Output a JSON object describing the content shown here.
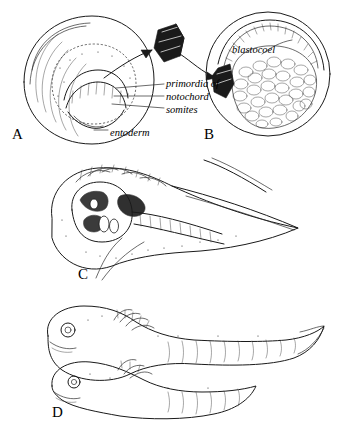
{
  "figure": {
    "title": "",
    "panels": [
      {
        "id": "A",
        "letter": "A"
      },
      {
        "id": "B",
        "letter": "B"
      },
      {
        "id": "C",
        "letter": "C"
      },
      {
        "id": "D",
        "letter": "D"
      }
    ],
    "annotations": {
      "primordia_of": "primordia of",
      "notochord": "notochord",
      "somites": "somites",
      "entoderm": "entoderm",
      "blastocoel": "blastocoel"
    },
    "colors": {
      "ink": "#1a1a1a",
      "background": "#ffffff",
      "graft": "#111111"
    }
  }
}
